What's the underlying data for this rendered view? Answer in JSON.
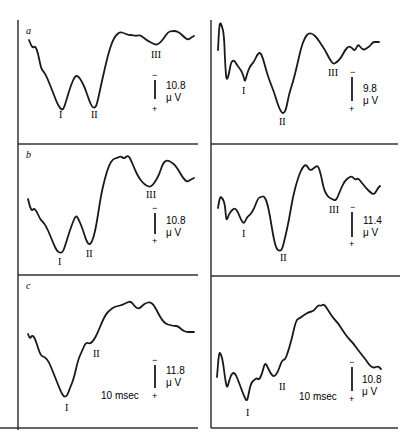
{
  "chart_data": [
    {
      "type": "line",
      "panel": "a",
      "side": "left",
      "title": "",
      "xlabel": "",
      "ylabel": "",
      "polarity": "negative up",
      "scale_bar": {
        "value": "10.8",
        "unit": "μ V",
        "minus": "−",
        "plus": "+"
      },
      "time_label": "",
      "peak_labels": [
        {
          "label": "I",
          "x": 62,
          "y": 118
        },
        {
          "label": "II",
          "x": 95,
          "y": 118
        },
        {
          "label": "III",
          "x": 157,
          "y": 58
        }
      ],
      "points": [
        [
          29,
          40
        ],
        [
          31,
          45
        ],
        [
          33,
          48
        ],
        [
          35,
          46
        ],
        [
          37,
          50
        ],
        [
          39,
          58
        ],
        [
          41,
          68
        ],
        [
          43,
          71
        ],
        [
          46,
          75
        ],
        [
          50,
          85
        ],
        [
          54,
          95
        ],
        [
          57,
          103
        ],
        [
          60,
          108
        ],
        [
          62,
          110
        ],
        [
          64,
          108
        ],
        [
          67,
          98
        ],
        [
          71,
          85
        ],
        [
          75,
          76
        ],
        [
          78,
          76
        ],
        [
          81,
          80
        ],
        [
          85,
          88
        ],
        [
          89,
          100
        ],
        [
          92,
          107
        ],
        [
          95,
          108
        ],
        [
          97,
          104
        ],
        [
          100,
          90
        ],
        [
          104,
          72
        ],
        [
          108,
          55
        ],
        [
          112,
          42
        ],
        [
          116,
          35
        ],
        [
          120,
          32
        ],
        [
          124,
          33
        ],
        [
          128,
          35
        ],
        [
          132,
          35
        ],
        [
          136,
          36
        ],
        [
          140,
          35
        ],
        [
          144,
          38
        ],
        [
          148,
          41
        ],
        [
          152,
          43
        ],
        [
          156,
          45
        ],
        [
          160,
          43
        ],
        [
          164,
          38
        ],
        [
          168,
          32
        ],
        [
          172,
          31
        ],
        [
          176,
          31
        ],
        [
          180,
          33
        ],
        [
          184,
          37
        ],
        [
          188,
          40
        ],
        [
          192,
          37
        ],
        [
          194,
          36
        ]
      ]
    },
    {
      "type": "line",
      "panel": "a",
      "side": "right",
      "title": "",
      "xlabel": "",
      "ylabel": "",
      "scale_bar": {
        "value": "9.8",
        "unit": "μ V",
        "minus": "−",
        "plus": "+"
      },
      "time_label": "",
      "peak_labels": [
        {
          "label": "I",
          "x": 243,
          "y": 94
        },
        {
          "label": "II",
          "x": 281,
          "y": 124
        },
        {
          "label": "III",
          "x": 335,
          "y": 76
        }
      ],
      "points": [
        [
          218,
          50
        ],
        [
          219,
          30
        ],
        [
          220,
          22
        ],
        [
          222,
          26
        ],
        [
          224,
          35
        ],
        [
          225,
          60
        ],
        [
          226,
          76
        ],
        [
          227,
          80
        ],
        [
          229,
          74
        ],
        [
          231,
          62
        ],
        [
          234,
          60
        ],
        [
          237,
          65
        ],
        [
          240,
          69
        ],
        [
          242,
          72
        ],
        [
          244,
          78
        ],
        [
          245,
          82
        ],
        [
          247,
          74
        ],
        [
          250,
          66
        ],
        [
          254,
          62
        ],
        [
          257,
          55
        ],
        [
          260,
          52
        ],
        [
          263,
          58
        ],
        [
          266,
          70
        ],
        [
          270,
          82
        ],
        [
          274,
          92
        ],
        [
          277,
          102
        ],
        [
          280,
          110
        ],
        [
          283,
          114
        ],
        [
          286,
          110
        ],
        [
          289,
          94
        ],
        [
          293,
          82
        ],
        [
          297,
          66
        ],
        [
          301,
          48
        ],
        [
          305,
          37
        ],
        [
          309,
          33
        ],
        [
          313,
          34
        ],
        [
          317,
          38
        ],
        [
          321,
          44
        ],
        [
          325,
          50
        ],
        [
          329,
          58
        ],
        [
          333,
          64
        ],
        [
          336,
          63
        ],
        [
          341,
          58
        ],
        [
          345,
          50
        ],
        [
          349,
          46
        ],
        [
          352,
          48
        ],
        [
          355,
          51
        ],
        [
          358,
          44
        ],
        [
          361,
          48
        ],
        [
          364,
          50
        ],
        [
          367,
          48
        ],
        [
          370,
          46
        ],
        [
          373,
          42
        ],
        [
          376,
          42
        ],
        [
          379,
          42
        ]
      ]
    },
    {
      "type": "line",
      "panel": "b",
      "side": "left",
      "title": "",
      "xlabel": "",
      "ylabel": "",
      "scale_bar": {
        "value": "10.8",
        "unit": "μ V",
        "minus": "−",
        "plus": "+"
      },
      "time_label": "",
      "peak_labels": [
        {
          "label": "I",
          "x": 60,
          "y": 263
        },
        {
          "label": "II",
          "x": 89,
          "y": 256
        },
        {
          "label": "III",
          "x": 152,
          "y": 197
        }
      ],
      "points": [
        [
          28,
          199
        ],
        [
          30,
          207
        ],
        [
          32,
          211
        ],
        [
          34,
          208
        ],
        [
          37,
          212
        ],
        [
          40,
          219
        ],
        [
          43,
          222
        ],
        [
          46,
          226
        ],
        [
          50,
          235
        ],
        [
          54,
          245
        ],
        [
          57,
          251
        ],
        [
          60,
          253
        ],
        [
          63,
          252
        ],
        [
          66,
          243
        ],
        [
          70,
          230
        ],
        [
          73,
          222
        ],
        [
          76,
          215
        ],
        [
          79,
          220
        ],
        [
          83,
          230
        ],
        [
          86,
          240
        ],
        [
          89,
          245
        ],
        [
          92,
          242
        ],
        [
          95,
          232
        ],
        [
          98,
          215
        ],
        [
          101,
          195
        ],
        [
          105,
          178
        ],
        [
          109,
          165
        ],
        [
          113,
          159
        ],
        [
          117,
          158
        ],
        [
          121,
          156
        ],
        [
          124,
          159
        ],
        [
          128,
          155
        ],
        [
          131,
          160
        ],
        [
          135,
          170
        ],
        [
          139,
          178
        ],
        [
          143,
          183
        ],
        [
          147,
          186
        ],
        [
          151,
          187
        ],
        [
          155,
          182
        ],
        [
          159,
          175
        ],
        [
          163,
          163
        ],
        [
          167,
          160
        ],
        [
          171,
          162
        ],
        [
          175,
          165
        ],
        [
          179,
          171
        ],
        [
          183,
          178
        ],
        [
          187,
          182
        ],
        [
          190,
          180
        ],
        [
          194,
          178
        ]
      ]
    },
    {
      "type": "line",
      "panel": "b",
      "side": "right",
      "title": "",
      "xlabel": "",
      "ylabel": "",
      "scale_bar": {
        "value": "11.4",
        "unit": "μ V",
        "minus": "−",
        "plus": "+"
      },
      "time_label": "",
      "peak_labels": [
        {
          "label": "I",
          "x": 243,
          "y": 237
        },
        {
          "label": "II",
          "x": 283,
          "y": 260
        },
        {
          "label": "III",
          "x": 334,
          "y": 212
        }
      ],
      "points": [
        [
          218,
          208
        ],
        [
          220,
          196
        ],
        [
          223,
          199
        ],
        [
          225,
          205
        ],
        [
          226,
          218
        ],
        [
          227,
          220
        ],
        [
          229,
          214
        ],
        [
          232,
          210
        ],
        [
          235,
          208
        ],
        [
          238,
          212
        ],
        [
          241,
          220
        ],
        [
          244,
          224
        ],
        [
          247,
          217
        ],
        [
          250,
          215
        ],
        [
          254,
          209
        ],
        [
          258,
          198
        ],
        [
          261,
          197
        ],
        [
          264,
          196
        ],
        [
          267,
          202
        ],
        [
          270,
          216
        ],
        [
          273,
          235
        ],
        [
          276,
          248
        ],
        [
          279,
          251
        ],
        [
          282,
          250
        ],
        [
          285,
          238
        ],
        [
          289,
          220
        ],
        [
          293,
          196
        ],
        [
          298,
          178
        ],
        [
          302,
          168
        ],
        [
          306,
          164
        ],
        [
          310,
          171
        ],
        [
          314,
          168
        ],
        [
          318,
          165
        ],
        [
          321,
          175
        ],
        [
          324,
          190
        ],
        [
          328,
          197
        ],
        [
          332,
          199
        ],
        [
          336,
          201
        ],
        [
          340,
          191
        ],
        [
          344,
          182
        ],
        [
          348,
          178
        ],
        [
          352,
          176
        ],
        [
          355,
          180
        ],
        [
          358,
          178
        ],
        [
          362,
          183
        ],
        [
          366,
          188
        ],
        [
          370,
          192
        ],
        [
          374,
          195
        ],
        [
          378,
          188
        ],
        [
          380,
          186
        ]
      ]
    },
    {
      "type": "line",
      "panel": "c",
      "side": "left",
      "title": "",
      "xlabel": "",
      "ylabel": "",
      "scale_bar": {
        "value": "11.8",
        "unit": "μ V",
        "minus": "−",
        "plus": "+"
      },
      "time_label": "10 msec",
      "peak_labels": [
        {
          "label": "I",
          "x": 67,
          "y": 411
        },
        {
          "label": "II",
          "x": 97,
          "y": 356
        }
      ],
      "points": [
        [
          28,
          334
        ],
        [
          30,
          339
        ],
        [
          32,
          335
        ],
        [
          35,
          338
        ],
        [
          38,
          348
        ],
        [
          41,
          356
        ],
        [
          45,
          357
        ],
        [
          49,
          362
        ],
        [
          53,
          372
        ],
        [
          57,
          382
        ],
        [
          61,
          392
        ],
        [
          64,
          397
        ],
        [
          67,
          396
        ],
        [
          70,
          388
        ],
        [
          74,
          378
        ],
        [
          78,
          360
        ],
        [
          82,
          351
        ],
        [
          86,
          342
        ],
        [
          90,
          344
        ],
        [
          94,
          340
        ],
        [
          98,
          332
        ],
        [
          102,
          322
        ],
        [
          106,
          314
        ],
        [
          110,
          310
        ],
        [
          114,
          307
        ],
        [
          118,
          306
        ],
        [
          122,
          305
        ],
        [
          126,
          303
        ],
        [
          131,
          301
        ],
        [
          135,
          307
        ],
        [
          139,
          309
        ],
        [
          143,
          305
        ],
        [
          146,
          303
        ],
        [
          150,
          302
        ],
        [
          154,
          305
        ],
        [
          158,
          313
        ],
        [
          162,
          320
        ],
        [
          166,
          324
        ],
        [
          170,
          325
        ],
        [
          174,
          326
        ],
        [
          178,
          326
        ],
        [
          182,
          330
        ],
        [
          186,
          332
        ],
        [
          190,
          332
        ],
        [
          194,
          332
        ]
      ]
    },
    {
      "type": "line",
      "panel": "c",
      "side": "right",
      "title": "",
      "xlabel": "",
      "ylabel": "",
      "scale_bar": {
        "value": "10.8",
        "unit": "μ V",
        "minus": "−",
        "plus": "+"
      },
      "time_label": "10 msec",
      "peak_labels": [
        {
          "label": "I",
          "x": 248,
          "y": 415
        },
        {
          "label": "II",
          "x": 280,
          "y": 389
        }
      ],
      "points": [
        [
          217,
          377
        ],
        [
          219,
          352
        ],
        [
          221,
          354
        ],
        [
          223,
          362
        ],
        [
          225,
          378
        ],
        [
          227,
          389
        ],
        [
          229,
          381
        ],
        [
          232,
          373
        ],
        [
          235,
          373
        ],
        [
          238,
          380
        ],
        [
          241,
          388
        ],
        [
          244,
          396
        ],
        [
          247,
          402
        ],
        [
          249,
          392
        ],
        [
          251,
          383
        ],
        [
          254,
          380
        ],
        [
          257,
          378
        ],
        [
          259,
          380
        ],
        [
          262,
          374
        ],
        [
          265,
          362
        ],
        [
          268,
          368
        ],
        [
          271,
          374
        ],
        [
          274,
          377
        ],
        [
          278,
          372
        ],
        [
          282,
          360
        ],
        [
          285,
          360
        ],
        [
          288,
          352
        ],
        [
          292,
          338
        ],
        [
          296,
          320
        ],
        [
          300,
          318
        ],
        [
          304,
          315
        ],
        [
          309,
          312
        ],
        [
          314,
          311
        ],
        [
          318,
          305
        ],
        [
          321,
          306
        ],
        [
          324,
          304
        ],
        [
          328,
          310
        ],
        [
          333,
          318
        ],
        [
          338,
          323
        ],
        [
          343,
          331
        ],
        [
          348,
          338
        ],
        [
          353,
          343
        ],
        [
          358,
          350
        ],
        [
          362,
          355
        ],
        [
          366,
          360
        ],
        [
          370,
          366
        ],
        [
          374,
          368
        ],
        [
          378,
          366
        ],
        [
          381,
          369
        ]
      ]
    }
  ],
  "figure": {
    "panel_letters": [
      "a",
      "b",
      "c"
    ],
    "line_color": "#1a1a1a",
    "frame_color": "#333333",
    "background": "#ffffff"
  },
  "labels": {
    "a_left_scale": "10.8",
    "a_right_scale": "9.8",
    "b_left_scale": "10.8",
    "b_right_scale": "11.4",
    "c_left_scale": "11.8",
    "c_right_scale": "10.8",
    "unit": "μ V",
    "time": "10 msec",
    "minus": "−",
    "plus": "+",
    "letter_a": "a",
    "letter_b": "b",
    "letter_c": "c",
    "I": "I",
    "II": "II",
    "III": "III"
  }
}
